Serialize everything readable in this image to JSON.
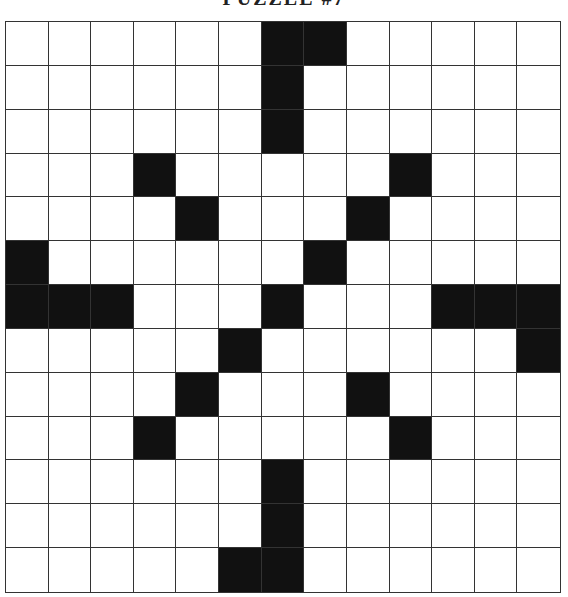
{
  "title": "PUZZLE #7",
  "grid": {
    "rows": 13,
    "cols": 13,
    "colors": {
      "black": "#111111",
      "white": "#ffffff",
      "line": "#333333"
    },
    "black_cells": [
      [
        0,
        6
      ],
      [
        0,
        7
      ],
      [
        1,
        6
      ],
      [
        2,
        6
      ],
      [
        3,
        3
      ],
      [
        3,
        9
      ],
      [
        4,
        4
      ],
      [
        4,
        8
      ],
      [
        5,
        0
      ],
      [
        5,
        7
      ],
      [
        6,
        0
      ],
      [
        6,
        1
      ],
      [
        6,
        2
      ],
      [
        6,
        6
      ],
      [
        6,
        10
      ],
      [
        6,
        11
      ],
      [
        6,
        12
      ],
      [
        7,
        5
      ],
      [
        7,
        12
      ],
      [
        8,
        4
      ],
      [
        8,
        8
      ],
      [
        9,
        3
      ],
      [
        9,
        9
      ],
      [
        10,
        6
      ],
      [
        11,
        6
      ],
      [
        12,
        5
      ],
      [
        12,
        6
      ]
    ]
  }
}
